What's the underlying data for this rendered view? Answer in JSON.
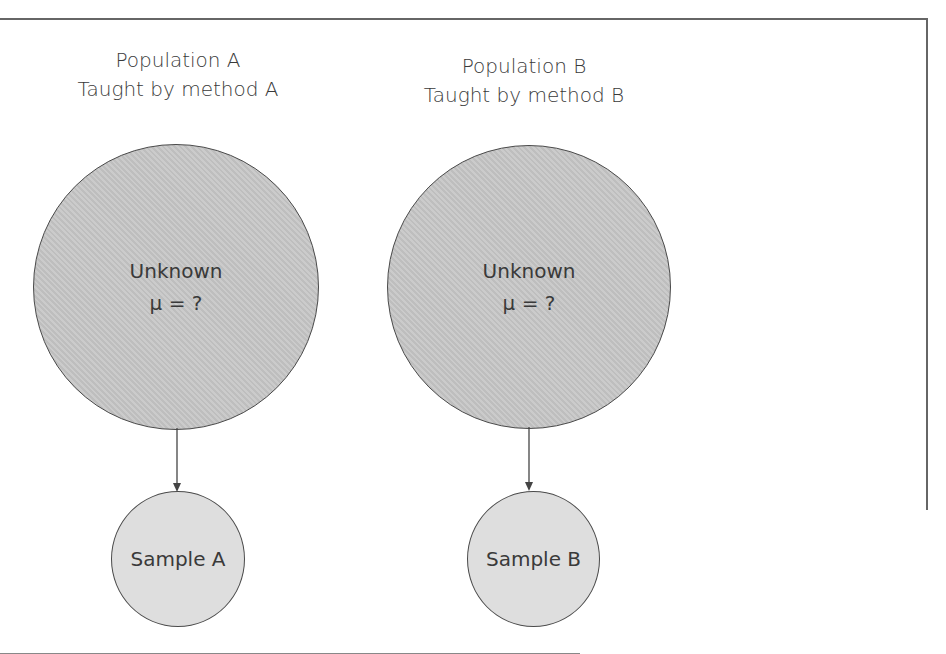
{
  "diagram": {
    "populations": [
      {
        "title": "Population A",
        "subtitle": "Taught by method A",
        "circle_line1": "Unknown",
        "circle_line2": "μ  =  ?",
        "sample_label": "Sample A"
      },
      {
        "title": "Population B",
        "subtitle": "Taught by method B",
        "circle_line1": "Unknown",
        "circle_line2": "μ  =  ?",
        "sample_label": "Sample B"
      }
    ],
    "colors": {
      "population_fill": "#c4c4c4",
      "sample_fill": "#dedede",
      "stroke": "#4a4a4a"
    }
  }
}
